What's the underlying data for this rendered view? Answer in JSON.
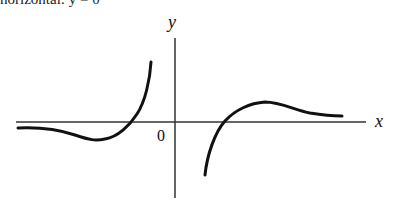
{
  "caption": "horizontal: y = 0",
  "axes": {
    "x_label": "x",
    "y_label": "y",
    "origin_label": "0"
  },
  "curves": [
    {
      "name": "left-branch",
      "description": "approaches y=0 from below as x→-∞, dips to a minimum, crosses x-axis, rises steeply toward vertical asymptote left of y-axis"
    },
    {
      "name": "right-branch",
      "description": "rises from -∞ right of y-axis, crosses x-axis, reaches a local maximum, then decays toward y=0 as x→+∞"
    }
  ],
  "colors": {
    "ink": "#111111",
    "axis": "#333333"
  }
}
